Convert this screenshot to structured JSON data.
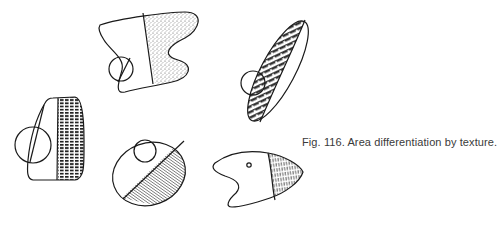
{
  "figure": {
    "caption": "Fig. 116.  Area differentiation by texture.",
    "shapes": [
      {
        "name": "s-shape",
        "texture": "stipple"
      },
      {
        "name": "tilted-ellipse",
        "texture": "zigzag"
      },
      {
        "name": "rounded-trapezoid",
        "texture": "grid-dashes"
      },
      {
        "name": "oval",
        "texture": "diagonal-lines"
      },
      {
        "name": "fish-shape",
        "texture": "vertical-dashes"
      }
    ],
    "colors": {
      "ink": "#1a1a1a",
      "background": "#ffffff",
      "caption": "#3a3a3a"
    }
  }
}
